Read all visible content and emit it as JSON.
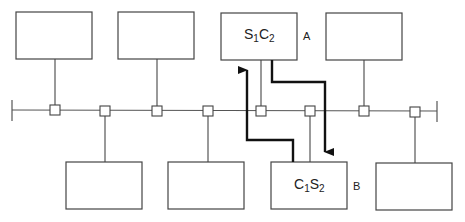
{
  "diagram": {
    "title": "",
    "bus": {
      "x1": 12,
      "x2": 437,
      "y": 110,
      "color": "#555555"
    },
    "taps": [
      55,
      105,
      157,
      208,
      261,
      310,
      364,
      415
    ],
    "top_nodes": [
      {
        "x": 16,
        "y": 12,
        "w": 76,
        "h": 47,
        "tap_x": 55,
        "label": ""
      },
      {
        "x": 118,
        "y": 12,
        "w": 76,
        "h": 47,
        "tap_x": 157,
        "label": ""
      },
      {
        "x": 221,
        "y": 13,
        "w": 76,
        "h": 47,
        "tap_x": 261,
        "label": "S1C2",
        "tag": "A"
      },
      {
        "x": 326,
        "y": 13,
        "w": 76,
        "h": 47,
        "tap_x": 364,
        "label": ""
      }
    ],
    "bottom_nodes": [
      {
        "x": 66,
        "y": 162,
        "w": 76,
        "h": 47,
        "tap_x": 105,
        "label": ""
      },
      {
        "x": 168,
        "y": 162,
        "w": 76,
        "h": 47,
        "tap_x": 208,
        "label": ""
      },
      {
        "x": 271,
        "y": 162,
        "w": 76,
        "h": 47,
        "tap_x": 310,
        "label": "C1S2",
        "tag": "B"
      },
      {
        "x": 376,
        "y": 163,
        "w": 76,
        "h": 47,
        "tap_x": 415,
        "label": ""
      }
    ],
    "node_A": {
      "main": "S",
      "sub1": "1",
      "main2": "C",
      "sub2": "2",
      "tag": "A"
    },
    "node_B": {
      "main": "C",
      "sub1": "1",
      "main2": "S",
      "sub2": "2",
      "tag": "B"
    },
    "flows": [
      {
        "name": "A-to-B",
        "direction": "down"
      },
      {
        "name": "B-to-A",
        "direction": "up"
      }
    ],
    "colors": {
      "line": "#555555",
      "thick": "#111111",
      "box": "#444444"
    }
  }
}
